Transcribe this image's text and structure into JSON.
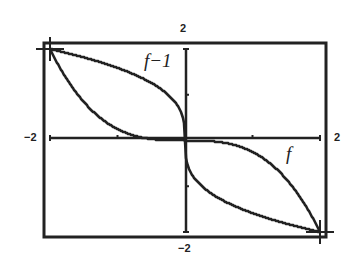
{
  "chart_data": {
    "type": "line",
    "title": "",
    "xlabel": "",
    "ylabel": "",
    "xlim": [
      -2,
      2
    ],
    "ylim": [
      -2,
      2
    ],
    "grid": false,
    "window_labels": {
      "ymax": "2",
      "ymin": "-2",
      "xmin": "-2",
      "xmax": "2"
    },
    "ticks": {
      "x": [
        -1,
        1
      ],
      "y": [
        -1,
        1
      ]
    },
    "series": [
      {
        "name": "f",
        "label": "f",
        "formula": "f(x) = -x^3/4",
        "x": [
          -2,
          -1.5,
          -1,
          -0.5,
          0,
          0.5,
          1,
          1.5,
          2
        ],
        "y": [
          2,
          0.84,
          0.25,
          0.03,
          0,
          -0.03,
          -0.25,
          -0.84,
          -2
        ]
      },
      {
        "name": "f-1",
        "label": "f−1",
        "formula": "f^-1(x) = -cbrt(4x)",
        "x": [
          -2,
          -1.5,
          -1,
          -0.5,
          0,
          0.5,
          1,
          1.5,
          2
        ],
        "y": [
          2,
          1.82,
          1.59,
          1.26,
          0,
          -1.26,
          -1.59,
          -1.82,
          -2
        ]
      }
    ],
    "annotations": [
      "f−1",
      "f"
    ]
  },
  "labels": {
    "ymax": "2",
    "ymin": "−2",
    "xmin": "−2",
    "xmax": "2",
    "curve_f": "f",
    "curve_finv": "f−1"
  },
  "colors": {
    "ink": "#222222",
    "background": "#ffffff"
  }
}
